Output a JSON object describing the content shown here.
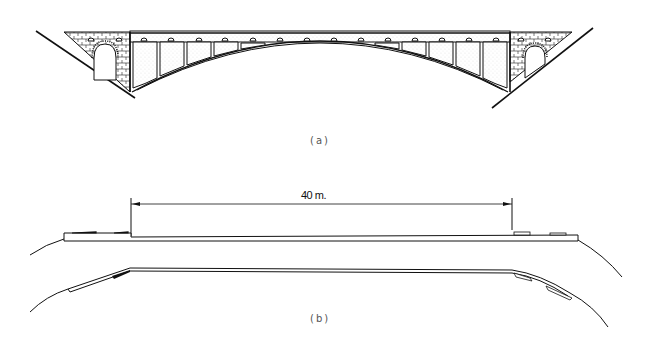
{
  "figure": {
    "panel_a": {
      "caption": "(a)",
      "subject": "stone-abutment deck arch bridge elevation",
      "spandrel_openings_each_side": 5,
      "deck_drains_count": 16
    },
    "panel_b": {
      "caption": "(b)",
      "subject": "arch span schematic with dimension",
      "dimension_label": "40 m."
    },
    "colors": {
      "ink": "#1a1a1a",
      "caption": "#555555",
      "background": "#ffffff"
    }
  }
}
